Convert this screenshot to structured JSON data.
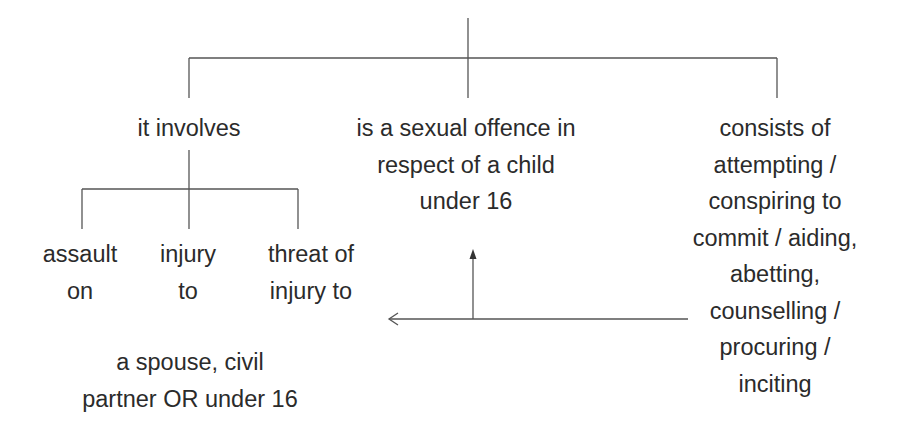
{
  "diagram": {
    "type": "tree",
    "colors": {
      "text": "#2b2b2b",
      "line": "#555555",
      "background": "#ffffff"
    },
    "branches": [
      {
        "id": "involves",
        "lines": [
          "it involves"
        ],
        "children": [
          {
            "id": "assault",
            "lines": [
              "assault",
              "on"
            ]
          },
          {
            "id": "injury",
            "lines": [
              "injury",
              "to"
            ]
          },
          {
            "id": "threat",
            "lines": [
              "threat of",
              "injury to"
            ]
          }
        ],
        "target": {
          "id": "victims",
          "lines": [
            "a spouse, civil",
            "partner OR under 16"
          ]
        }
      },
      {
        "id": "sexual-offence",
        "lines": [
          "is a sexual offence in",
          "respect of a child",
          "under 16"
        ]
      },
      {
        "id": "consists",
        "lines": [
          "consists of",
          "attempting /",
          "conspiring to",
          "commit / aiding,",
          "abetting,",
          "counselling /",
          "procuring /",
          "inciting"
        ]
      }
    ],
    "arrows": [
      {
        "from": "consists",
        "to": "involves-children",
        "direction": "left"
      },
      {
        "from": "consists",
        "to": "sexual-offence",
        "direction": "up"
      }
    ]
  }
}
